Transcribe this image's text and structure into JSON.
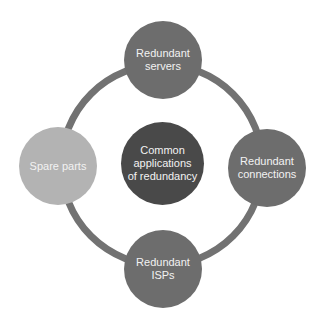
{
  "diagram": {
    "type": "radial-cycle",
    "colors": {
      "ring": "#727272",
      "outer_node": "#6d6d6d",
      "outer_node_light": "#b3b3b3",
      "center_node": "#494949",
      "text": "#f2f2f2"
    },
    "center": {
      "label": "Common applications of redundancy"
    },
    "nodes": [
      {
        "position": "top",
        "label": "Redundant servers"
      },
      {
        "position": "right",
        "label": "Redundant connections"
      },
      {
        "position": "bottom",
        "label": "Redundant ISPs"
      },
      {
        "position": "left",
        "label": "Spare parts"
      }
    ]
  }
}
